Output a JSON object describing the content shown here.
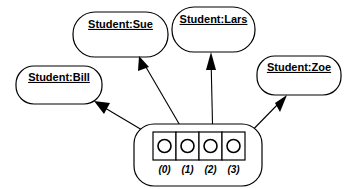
{
  "diagram": {
    "type": "uml-object-diagram",
    "title": "",
    "colors": {
      "stroke": "#000000",
      "fill": "#ffffff",
      "text": "#000000"
    },
    "objects": [
      {
        "id": "sue",
        "label": "Student:Sue",
        "underlined": true,
        "x": 73,
        "y": 12,
        "w": 95,
        "h": 45
      },
      {
        "id": "lars",
        "label": "Student:Lars",
        "underlined": true,
        "x": 172,
        "y": 7,
        "w": 83,
        "h": 45
      },
      {
        "id": "bill",
        "label": "Student:Bill",
        "underlined": true,
        "x": 16,
        "y": 66,
        "w": 86,
        "h": 38
      },
      {
        "id": "zoe",
        "label": "Student:Zoe",
        "underlined": true,
        "x": 257,
        "y": 56,
        "w": 84,
        "h": 39
      }
    ],
    "array": {
      "name": "array-object",
      "outer": {
        "x": 134,
        "y": 124,
        "w": 128,
        "h": 62
      },
      "cells": [
        {
          "index_label": "(0)",
          "has_reference": true,
          "target": "bill"
        },
        {
          "index_label": "(1)",
          "has_reference": true,
          "target": "sue"
        },
        {
          "index_label": "(2)",
          "has_reference": true,
          "target": "lars"
        },
        {
          "index_label": "(3)",
          "has_reference": true,
          "target": "zoe"
        }
      ]
    },
    "references": [
      {
        "from_index": "(0)",
        "to": "Student:Bill",
        "direction": "up-left"
      },
      {
        "from_index": "(1)",
        "to": "Student:Sue",
        "direction": "up-left"
      },
      {
        "from_index": "(2)",
        "to": "Student:Lars",
        "direction": "up"
      },
      {
        "from_index": "(3)",
        "to": "Student:Zoe",
        "direction": "up-right"
      }
    ]
  }
}
